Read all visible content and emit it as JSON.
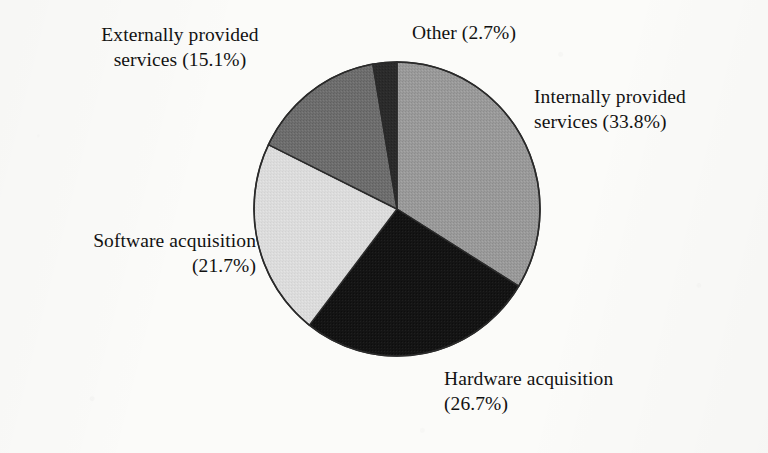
{
  "figure": {
    "background_color": "#fbfbf9",
    "text_color": "#121212",
    "outline_color": "#2a2a2a"
  },
  "chart_data": {
    "type": "pie",
    "title": "",
    "subtitle": "",
    "xlabel": "",
    "ylabel": "",
    "grid": false,
    "legend_position": "none",
    "label_style": "outside-callout-text",
    "start_angle_deg": 0,
    "direction": "clockwise",
    "units": "percent",
    "total": 100.0,
    "center": {
      "x": 397,
      "y": 209
    },
    "radius": {
      "x": 143,
      "y": 147
    },
    "categories": [
      "Internally provided services",
      "Hardware acquisition",
      "Software acquisition",
      "Externally provided services",
      "Other"
    ],
    "values": [
      33.8,
      26.7,
      21.7,
      15.1,
      2.7
    ],
    "colors": [
      "#9a9a9a",
      "#1a1a1a",
      "#dcdcdc",
      "#6e6e6e",
      "#2b2b2b"
    ],
    "slices": [
      {
        "name": "Internally provided services",
        "value": 33.8,
        "value_text": "33.8%",
        "color": "#9a9a9a",
        "start_deg": 0.0,
        "end_deg": 121.68,
        "label_line1": "Internally provided",
        "label_line2": "services (33.8%)"
      },
      {
        "name": "Hardware acquisition",
        "value": 26.7,
        "value_text": "26.7%",
        "color": "#1a1a1a",
        "start_deg": 121.68,
        "end_deg": 217.8,
        "label_line1": "Hardware acquisition",
        "label_line2": "(26.7%)"
      },
      {
        "name": "Software acquisition",
        "value": 21.7,
        "value_text": "21.7%",
        "color": "#dcdcdc",
        "start_deg": 217.8,
        "end_deg": 295.92,
        "label_line1": "Software acquisition",
        "label_line2": "(21.7%)"
      },
      {
        "name": "Externally provided services",
        "value": 15.1,
        "value_text": "15.1%",
        "color": "#6e6e6e",
        "start_deg": 295.92,
        "end_deg": 350.28,
        "label_line1": "Externally provided",
        "label_line2": "services (15.1%)"
      },
      {
        "name": "Other",
        "value": 2.7,
        "value_text": "2.7%",
        "color": "#2b2b2b",
        "start_deg": 350.28,
        "end_deg": 360.0,
        "label_line1": "Other (2.7%)",
        "label_line2": ""
      }
    ]
  },
  "labels": {
    "externally": {
      "line1": "Externally provided",
      "line2": "services (15.1%)"
    },
    "other": {
      "line1": "Other (2.7%)"
    },
    "internally": {
      "line1": "Internally provided",
      "line2": "services (33.8%)"
    },
    "software": {
      "line1": "Software acquisition",
      "line2": "(21.7%)"
    },
    "hardware": {
      "line1": "Hardware acquisition",
      "line2": "(26.7%)"
    }
  }
}
